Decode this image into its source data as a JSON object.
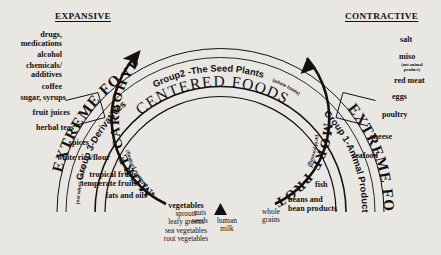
{
  "diagram": {
    "title_left": "EXPANSIVE",
    "title_right": "CONTRACTIVE",
    "center_band": "CENTERED FOODS",
    "band_left": "EXTREME FOODS",
    "band_right": "EXTREME FOODS",
    "group3_label": "Group 3-Derivatives",
    "group3_sub": "(not whole foods)",
    "group2_label": "Group2 -The Seed Plants",
    "group2_sub": "(whole foods)",
    "group1_label": "Group 1-Animal Products",
    "arrow_left_label": "MORE CARBOHYDRATE",
    "arrow_left_sub": "(alkaline forming)",
    "arrow_right_label": "MORE PROTEIN",
    "arrow_right_sub": "(acid forming)",
    "center_marker": "triangle-marker"
  },
  "left_foods": [
    {
      "id": "drugs-medications",
      "lines": [
        "drugs,",
        "medications"
      ]
    },
    {
      "id": "alcohol",
      "lines": [
        "alcohol"
      ]
    },
    {
      "id": "chemicals-additives",
      "lines": [
        "chemicals/",
        "additives"
      ]
    },
    {
      "id": "coffee",
      "lines": [
        "coffee"
      ]
    },
    {
      "id": "sugar-syrups",
      "lines": [
        "sugar, syrups"
      ]
    },
    {
      "id": "fruit-juices",
      "lines": [
        "fruit juices"
      ]
    },
    {
      "id": "herbal-teas",
      "lines": [
        "herbal teas*"
      ]
    },
    {
      "id": "spices",
      "lines": [
        "spices"
      ]
    },
    {
      "id": "white-rice-flour",
      "lines": [
        "white rice/flour"
      ]
    },
    {
      "id": "tropical-temperate-fruits",
      "lines": [
        "tropical fruits",
        "temperate fruits"
      ]
    },
    {
      "id": "fats-and-oils",
      "lines": [
        "fats and oils**"
      ]
    }
  ],
  "right_foods": [
    {
      "id": "salt",
      "lines": [
        "salt"
      ],
      "sub": null
    },
    {
      "id": "miso",
      "lines": [
        "miso"
      ],
      "sub": [
        "(not animal",
        "product)"
      ]
    },
    {
      "id": "red-meat",
      "lines": [
        "red meat"
      ],
      "sub": null
    },
    {
      "id": "eggs",
      "lines": [
        "eggs"
      ],
      "sub": null
    },
    {
      "id": "poultry",
      "lines": [
        "poultry"
      ],
      "sub": null
    },
    {
      "id": "cheese",
      "lines": [
        "cheese"
      ],
      "sub": null
    },
    {
      "id": "seafood",
      "lines": [
        "seafood"
      ],
      "sub": null
    },
    {
      "id": "fish",
      "lines": [
        "fish"
      ],
      "sub": null
    },
    {
      "id": "beans-bean-products",
      "lines": [
        "beans and",
        "bean products"
      ],
      "sub": null
    }
  ],
  "center_foods": [
    {
      "id": "vegetables-group",
      "lines": [
        "vegetables",
        "sprouts",
        "leafy greens",
        "sea vegetables",
        "root vegetables"
      ]
    },
    {
      "id": "nuts-seeds",
      "lines": [
        "nuts",
        "seeds"
      ]
    },
    {
      "id": "human-milk",
      "lines": [
        "human",
        "milk"
      ]
    },
    {
      "id": "whole-grains",
      "lines": [
        "whole",
        "grains"
      ]
    }
  ]
}
